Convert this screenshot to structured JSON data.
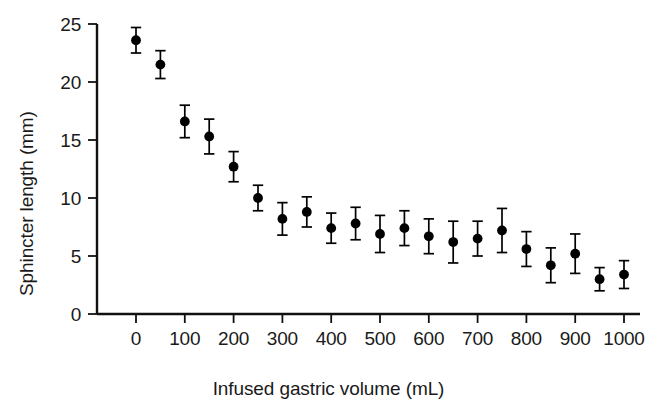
{
  "chart_data": {
    "type": "scatter",
    "title": "",
    "xlabel": "Infused gastric volume (mL)",
    "ylabel": "Sphincter length (mm)",
    "xlim": [
      -40,
      1040
    ],
    "ylim": [
      0,
      25
    ],
    "grid": false,
    "legend": "none",
    "xticks": [
      "0",
      "100",
      "200",
      "300",
      "400",
      "500",
      "600",
      "700",
      "800",
      "900",
      "1000"
    ],
    "xtick_values": [
      0,
      100,
      200,
      300,
      400,
      500,
      600,
      700,
      800,
      900,
      1000
    ],
    "yticks": [
      "0",
      "5",
      "10",
      "15",
      "20",
      "25"
    ],
    "ytick_values": [
      0,
      5,
      10,
      15,
      20,
      25
    ],
    "marker": "filled-circle",
    "marker_color": "#000000",
    "errorbar_color": "#000000",
    "errorbar_style": "capped-vertical",
    "x": [
      0,
      50,
      100,
      150,
      200,
      250,
      300,
      350,
      400,
      450,
      500,
      550,
      600,
      650,
      700,
      750,
      800,
      850,
      900,
      950,
      1000
    ],
    "values": [
      23.6,
      21.5,
      16.6,
      15.3,
      12.7,
      10.0,
      8.2,
      8.8,
      7.4,
      7.8,
      6.9,
      7.4,
      6.7,
      6.2,
      6.5,
      7.2,
      5.6,
      4.2,
      5.2,
      3.0,
      3.4
    ],
    "errors": [
      1.1,
      1.2,
      1.4,
      1.5,
      1.3,
      1.1,
      1.4,
      1.3,
      1.3,
      1.4,
      1.6,
      1.5,
      1.5,
      1.8,
      1.5,
      1.9,
      1.5,
      1.5,
      1.7,
      1.0,
      1.2
    ],
    "series": [
      {
        "name": "Sphincter length",
        "points": [
          {
            "x": 0,
            "y": 23.6,
            "err": 1.1
          },
          {
            "x": 50,
            "y": 21.5,
            "err": 1.2
          },
          {
            "x": 100,
            "y": 16.6,
            "err": 1.4
          },
          {
            "x": 150,
            "y": 15.3,
            "err": 1.5
          },
          {
            "x": 200,
            "y": 12.7,
            "err": 1.3
          },
          {
            "x": 250,
            "y": 10.0,
            "err": 1.1
          },
          {
            "x": 300,
            "y": 8.2,
            "err": 1.4
          },
          {
            "x": 350,
            "y": 8.8,
            "err": 1.3
          },
          {
            "x": 400,
            "y": 7.4,
            "err": 1.3
          },
          {
            "x": 450,
            "y": 7.8,
            "err": 1.4
          },
          {
            "x": 500,
            "y": 6.9,
            "err": 1.6
          },
          {
            "x": 550,
            "y": 7.4,
            "err": 1.5
          },
          {
            "x": 600,
            "y": 6.7,
            "err": 1.5
          },
          {
            "x": 650,
            "y": 6.2,
            "err": 1.8
          },
          {
            "x": 700,
            "y": 6.5,
            "err": 1.5
          },
          {
            "x": 750,
            "y": 7.2,
            "err": 1.9
          },
          {
            "x": 800,
            "y": 5.6,
            "err": 1.5
          },
          {
            "x": 850,
            "y": 4.2,
            "err": 1.5
          },
          {
            "x": 900,
            "y": 5.2,
            "err": 1.7
          },
          {
            "x": 950,
            "y": 3.0,
            "err": 1.0
          },
          {
            "x": 1000,
            "y": 3.4,
            "err": 1.2
          }
        ]
      }
    ]
  }
}
